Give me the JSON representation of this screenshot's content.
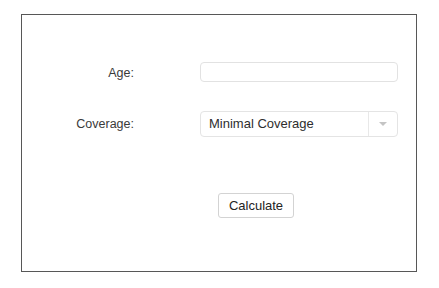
{
  "window": {
    "frame_color": "#575757",
    "background_color": "#ffffff"
  },
  "form": {
    "fields": [
      {
        "label": "Age:",
        "type": "text",
        "value": "",
        "placeholder": ""
      },
      {
        "label": "Coverage:",
        "type": "select",
        "value": "Minimal Coverage",
        "dropdown_icon": "chevron-down-icon"
      }
    ],
    "submit": {
      "label": "Calculate"
    }
  }
}
